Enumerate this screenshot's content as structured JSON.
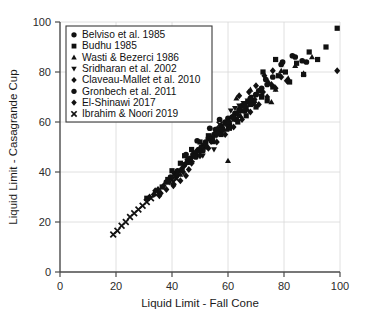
{
  "chart_data": {
    "type": "scatter",
    "title": "",
    "xlabel": "Liquid Limit - Fall Cone",
    "ylabel": "Liquid Limit - Casagrande Cup",
    "xlim": [
      0,
      100
    ],
    "ylim": [
      0,
      100
    ],
    "xticks": [
      0,
      20,
      40,
      60,
      80,
      100
    ],
    "yticks": [
      0,
      20,
      40,
      60,
      80,
      100
    ],
    "grid": true,
    "legend_position": "upper-left",
    "series": [
      {
        "name": "Belviso et al. 1985",
        "marker": "circle",
        "color": "#111111",
        "points": [
          [
            43.5,
            41.0
          ],
          [
            44.5,
            43.0
          ],
          [
            45.5,
            44.0
          ],
          [
            46.5,
            45.5
          ],
          [
            47.5,
            47.0
          ],
          [
            48.5,
            46.0
          ],
          [
            49.5,
            49.0
          ],
          [
            50.5,
            50.0
          ],
          [
            51.0,
            48.5
          ],
          [
            52.0,
            52.0
          ],
          [
            53.0,
            53.5
          ],
          [
            54.0,
            52.5
          ],
          [
            55.0,
            55.0
          ],
          [
            55.5,
            57.0
          ],
          [
            56.5,
            56.0
          ],
          [
            57.5,
            58.5
          ],
          [
            58.0,
            57.0
          ],
          [
            59.0,
            60.0
          ],
          [
            60.0,
            61.5
          ],
          [
            60.5,
            59.0
          ],
          [
            61.5,
            62.0
          ],
          [
            62.5,
            63.5
          ],
          [
            63.0,
            61.0
          ],
          [
            64.0,
            65.0
          ],
          [
            65.0,
            66.5
          ],
          [
            66.0,
            64.5
          ],
          [
            67.0,
            68.0
          ],
          [
            68.0,
            69.5
          ],
          [
            69.0,
            67.5
          ],
          [
            70.0,
            71.0
          ],
          [
            71.0,
            72.5
          ],
          [
            72.0,
            70.5
          ],
          [
            38.0,
            36.0
          ],
          [
            39.5,
            38.0
          ],
          [
            41.0,
            39.5
          ],
          [
            42.0,
            40.5
          ],
          [
            73.5,
            77.0
          ],
          [
            79.0,
            83.0
          ],
          [
            84.0,
            86.0
          ],
          [
            88.0,
            84.0
          ]
        ]
      },
      {
        "name": "Budhu 1985",
        "marker": "square",
        "color": "#111111",
        "points": [
          [
            31.0,
            29.5
          ],
          [
            36.5,
            34.0
          ],
          [
            38.5,
            37.0
          ],
          [
            40.0,
            40.5
          ],
          [
            41.5,
            38.5
          ],
          [
            43.0,
            43.5
          ],
          [
            44.5,
            46.5
          ],
          [
            46.0,
            44.0
          ],
          [
            47.0,
            49.0
          ],
          [
            48.5,
            47.5
          ],
          [
            50.0,
            52.0
          ],
          [
            51.5,
            50.0
          ],
          [
            53.0,
            54.5
          ],
          [
            54.5,
            52.5
          ],
          [
            56.0,
            57.0
          ],
          [
            57.5,
            55.0
          ],
          [
            59.0,
            59.5
          ],
          [
            60.5,
            57.5
          ],
          [
            62.0,
            62.0
          ],
          [
            63.5,
            60.0
          ],
          [
            65.0,
            64.5
          ],
          [
            66.5,
            62.5
          ],
          [
            68.0,
            67.0
          ],
          [
            70.0,
            66.0
          ],
          [
            72.0,
            70.0
          ],
          [
            74.0,
            68.5
          ],
          [
            76.0,
            74.0
          ],
          [
            78.0,
            78.5
          ],
          [
            80.5,
            80.0
          ],
          [
            82.0,
            76.0
          ],
          [
            84.5,
            83.5
          ],
          [
            87.0,
            79.0
          ],
          [
            89.0,
            88.0
          ],
          [
            92.0,
            85.0
          ],
          [
            95.0,
            90.0
          ],
          [
            99.0,
            97.5
          ],
          [
            72.5,
            80.0
          ],
          [
            77.0,
            85.0
          ]
        ]
      },
      {
        "name": "Wasti & Bezerci 1986",
        "marker": "triangle-up",
        "color": "#111111",
        "points": [
          [
            43.0,
            39.0
          ],
          [
            46.5,
            44.5
          ],
          [
            49.0,
            47.0
          ],
          [
            52.0,
            50.5
          ],
          [
            54.5,
            52.0
          ],
          [
            57.0,
            55.5
          ],
          [
            59.5,
            57.0
          ],
          [
            62.0,
            61.0
          ],
          [
            64.5,
            62.5
          ],
          [
            67.0,
            65.0
          ],
          [
            60.0,
            44.5
          ],
          [
            69.5,
            68.5
          ],
          [
            72.0,
            70.0
          ],
          [
            74.5,
            76.0
          ],
          [
            77.0,
            73.0
          ],
          [
            79.0,
            80.5
          ],
          [
            81.5,
            77.5
          ],
          [
            84.0,
            82.5
          ],
          [
            87.0,
            79.5
          ],
          [
            90.0,
            86.0
          ],
          [
            68.0,
            73.0
          ],
          [
            63.0,
            69.5
          ],
          [
            75.5,
            68.0
          ]
        ]
      },
      {
        "name": "Sridharan et al. 2002",
        "marker": "triangle-down",
        "color": "#111111",
        "points": [
          [
            54.0,
            52.0
          ],
          [
            56.0,
            54.5
          ],
          [
            58.0,
            56.0
          ],
          [
            62.5,
            65.5
          ],
          [
            64.0,
            66.5
          ],
          [
            65.5,
            67.5
          ],
          [
            67.0,
            68.5
          ],
          [
            68.5,
            70.0
          ],
          [
            61.0,
            64.5
          ],
          [
            55.0,
            49.0
          ],
          [
            59.5,
            58.5
          ],
          [
            51.0,
            46.5
          ]
        ]
      },
      {
        "name": "Claveau-Mallet et al. 2010",
        "marker": "diamond",
        "color": "#111111",
        "points": [
          [
            40.0,
            37.5
          ],
          [
            42.0,
            40.0
          ],
          [
            44.0,
            42.0
          ],
          [
            45.5,
            45.0
          ],
          [
            47.0,
            43.5
          ],
          [
            48.5,
            48.0
          ],
          [
            50.0,
            46.5
          ],
          [
            51.5,
            51.0
          ],
          [
            53.0,
            49.5
          ],
          [
            54.5,
            54.0
          ],
          [
            56.0,
            52.0
          ],
          [
            57.5,
            57.0
          ],
          [
            59.0,
            55.0
          ],
          [
            60.5,
            60.0
          ],
          [
            62.0,
            58.0
          ],
          [
            63.5,
            63.0
          ],
          [
            65.0,
            61.0
          ],
          [
            66.5,
            66.0
          ],
          [
            68.0,
            64.0
          ],
          [
            69.5,
            69.0
          ],
          [
            71.0,
            67.0
          ],
          [
            72.5,
            72.0
          ],
          [
            74.0,
            70.0
          ],
          [
            75.5,
            75.0
          ],
          [
            77.0,
            73.5
          ],
          [
            79.0,
            78.0
          ],
          [
            81.0,
            76.5
          ],
          [
            70.0,
            74.5
          ],
          [
            73.0,
            78.5
          ],
          [
            76.0,
            80.5
          ],
          [
            67.5,
            72.0
          ],
          [
            64.0,
            70.5
          ],
          [
            99.0,
            80.5
          ]
        ]
      },
      {
        "name": "Gronbech et al. 2011",
        "marker": "circle",
        "color": "#111111",
        "points": [
          [
            46.0,
            44.0
          ],
          [
            48.0,
            46.5
          ],
          [
            50.0,
            48.5
          ],
          [
            52.0,
            51.0
          ],
          [
            54.0,
            53.0
          ],
          [
            56.0,
            55.5
          ],
          [
            58.0,
            57.5
          ],
          [
            60.0,
            60.0
          ],
          [
            62.0,
            62.0
          ],
          [
            64.0,
            64.5
          ],
          [
            66.0,
            66.5
          ],
          [
            68.0,
            69.0
          ],
          [
            70.0,
            71.0
          ],
          [
            72.0,
            73.5
          ],
          [
            74.0,
            75.0
          ],
          [
            76.0,
            78.0
          ],
          [
            79.5,
            84.0
          ],
          [
            83.0,
            86.5
          ],
          [
            86.5,
            84.5
          ],
          [
            45.0,
            47.0
          ],
          [
            49.0,
            52.5
          ],
          [
            53.5,
            57.5
          ],
          [
            57.0,
            61.0
          ]
        ]
      },
      {
        "name": "El-Shinawi 2017",
        "marker": "diamond",
        "color": "#111111",
        "points": [
          [
            32.0,
            30.0
          ],
          [
            33.5,
            31.0
          ],
          [
            35.0,
            33.0
          ],
          [
            36.0,
            31.5
          ],
          [
            37.0,
            34.5
          ],
          [
            38.0,
            33.0
          ],
          [
            39.0,
            36.0
          ],
          [
            40.5,
            34.5
          ],
          [
            41.5,
            38.0
          ],
          [
            43.0,
            36.5
          ],
          [
            44.0,
            40.0
          ],
          [
            45.0,
            38.5
          ],
          [
            34.0,
            32.5
          ],
          [
            35.5,
            30.5
          ],
          [
            42.0,
            39.0
          ],
          [
            46.0,
            41.0
          ]
        ]
      },
      {
        "name": "Ibrahim & Noori 2019",
        "marker": "x",
        "color": "#111111",
        "points": [
          [
            19.0,
            15.0
          ],
          [
            20.5,
            16.5
          ],
          [
            22.0,
            18.5
          ],
          [
            23.5,
            20.0
          ],
          [
            25.0,
            22.0
          ],
          [
            26.5,
            23.5
          ],
          [
            28.0,
            25.0
          ],
          [
            29.5,
            26.5
          ],
          [
            31.0,
            28.0
          ],
          [
            32.5,
            29.5
          ],
          [
            40.5,
            36.0
          ],
          [
            41.5,
            37.5
          ],
          [
            47.0,
            45.0
          ],
          [
            54.5,
            53.0
          ],
          [
            49.5,
            48.0
          ],
          [
            57.0,
            59.0
          ],
          [
            35.0,
            31.5
          ],
          [
            51.5,
            50.5
          ]
        ]
      }
    ]
  }
}
